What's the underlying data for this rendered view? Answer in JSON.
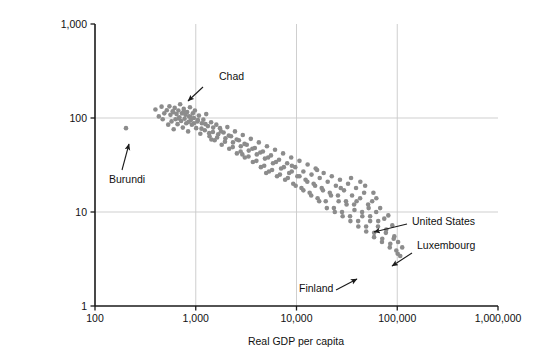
{
  "chart_data": {
    "type": "scatter",
    "title": "",
    "xlabel": "Real GDP per capita",
    "ylabel": "Child mortality (deaths per 1,000 live births)",
    "ylabel_line1": "Child mortality (deaths per",
    "ylabel_line2": "1,000 live births)",
    "xscale": "log",
    "yscale": "log",
    "xlim": [
      100,
      1000000
    ],
    "ylim": [
      1,
      1000
    ],
    "grid": true,
    "grid_color": "#c9c9c9",
    "legend": "none",
    "point_color": "#8c8c8c",
    "point_size_px": 4.6,
    "xticks": [
      100,
      1000,
      10000,
      100000,
      1000000
    ],
    "xticklabels": [
      "100",
      "1,000",
      "10,000",
      "100,000",
      "1,000,000"
    ],
    "yticks": [
      1,
      10,
      100,
      1000
    ],
    "yticklabels": [
      "1",
      "10",
      "100",
      "1,000"
    ],
    "n_points": 181,
    "annotations": [
      {
        "label": "Chad",
        "label_x": 219,
        "label_y": 80,
        "arrow_from_x": 203,
        "arrow_from_y": 87,
        "arrow_to_x": 188,
        "arrow_to_y": 101,
        "anchor": "start"
      },
      {
        "label": "Burundi",
        "label_x": 109,
        "label_y": 183,
        "arrow_from_x": 122,
        "arrow_from_y": 170,
        "arrow_to_x": 129,
        "arrow_to_y": 144,
        "anchor": "start"
      },
      {
        "label": "United States",
        "label_x": 412,
        "label_y": 225,
        "arrow_from_x": 407,
        "arrow_from_y": 224,
        "arrow_to_x": 374,
        "arrow_to_y": 232,
        "anchor": "start"
      },
      {
        "label": "Luxembourg",
        "label_x": 417,
        "label_y": 249,
        "arrow_from_x": 412,
        "arrow_from_y": 253,
        "arrow_to_x": 392,
        "arrow_to_y": 266,
        "anchor": "start"
      },
      {
        "label": "Finland",
        "label_x": 299,
        "label_y": 292,
        "arrow_from_x": 336,
        "arrow_from_y": 290,
        "arrow_to_x": 357,
        "arrow_to_y": 279,
        "anchor": "start"
      }
    ],
    "points": [
      [
        203,
        78
      ],
      [
        398,
        123
      ],
      [
        430,
        104
      ],
      [
        458,
        132
      ],
      [
        470,
        97
      ],
      [
        487,
        112
      ],
      [
        516,
        121
      ],
      [
        533,
        85
      ],
      [
        548,
        133
      ],
      [
        561,
        108
      ],
      [
        575,
        92
      ],
      [
        590,
        118
      ],
      [
        604,
        76
      ],
      [
        618,
        128
      ],
      [
        630,
        97
      ],
      [
        645,
        110
      ],
      [
        660,
        86
      ],
      [
        672,
        120
      ],
      [
        688,
        102
      ],
      [
        700,
        140
      ],
      [
        716,
        93
      ],
      [
        730,
        112
      ],
      [
        744,
        79
      ],
      [
        760,
        125
      ],
      [
        775,
        98
      ],
      [
        790,
        108
      ],
      [
        805,
        88
      ],
      [
        822,
        116
      ],
      [
        840,
        72
      ],
      [
        858,
        104
      ],
      [
        876,
        130
      ],
      [
        894,
        95
      ],
      [
        915,
        85
      ],
      [
        936,
        112
      ],
      [
        958,
        100
      ],
      [
        980,
        120
      ],
      [
        1010,
        78
      ],
      [
        1040,
        92
      ],
      [
        1075,
        106
      ],
      [
        1110,
        68
      ],
      [
        1150,
        88
      ],
      [
        1190,
        96
      ],
      [
        1230,
        74
      ],
      [
        1270,
        110
      ],
      [
        1320,
        82
      ],
      [
        1370,
        64
      ],
      [
        1420,
        90
      ],
      [
        1480,
        71
      ],
      [
        1540,
        58
      ],
      [
        1600,
        85
      ],
      [
        1670,
        67
      ],
      [
        1740,
        78
      ],
      [
        1810,
        52
      ],
      [
        1890,
        70
      ],
      [
        1970,
        61
      ],
      [
        2060,
        80
      ],
      [
        2150,
        47
      ],
      [
        2240,
        64
      ],
      [
        2340,
        55
      ],
      [
        2450,
        72
      ],
      [
        2560,
        42
      ],
      [
        2680,
        58
      ],
      [
        2800,
        50
      ],
      [
        2930,
        66
      ],
      [
        3070,
        38
      ],
      [
        3210,
        52
      ],
      [
        3360,
        45
      ],
      [
        3520,
        60
      ],
      [
        3690,
        34
      ],
      [
        3860,
        48
      ],
      [
        4040,
        41
      ],
      [
        4230,
        55
      ],
      [
        4430,
        30
      ],
      [
        4640,
        44
      ],
      [
        4860,
        37
      ],
      [
        5090,
        50
      ],
      [
        5330,
        27
      ],
      [
        5580,
        40
      ],
      [
        5840,
        33
      ],
      [
        6120,
        46
      ],
      [
        6410,
        24
      ],
      [
        6710,
        36
      ],
      [
        7030,
        29
      ],
      [
        7360,
        42
      ],
      [
        7710,
        22
      ],
      [
        8080,
        33
      ],
      [
        8460,
        26
      ],
      [
        8860,
        38
      ],
      [
        9280,
        20
      ],
      [
        9720,
        30
      ],
      [
        10200,
        24
      ],
      [
        10700,
        35
      ],
      [
        11200,
        18
      ],
      [
        11700,
        27
      ],
      [
        12300,
        22
      ],
      [
        12900,
        32
      ],
      [
        13500,
        16
      ],
      [
        14100,
        25
      ],
      [
        14800,
        20
      ],
      [
        15500,
        29
      ],
      [
        16200,
        14
      ],
      [
        17000,
        23
      ],
      [
        17800,
        18
      ],
      [
        18600,
        26
      ],
      [
        19500,
        13
      ],
      [
        20400,
        21
      ],
      [
        21400,
        16
      ],
      [
        22400,
        24
      ],
      [
        23500,
        11
      ],
      [
        24600,
        19
      ],
      [
        25800,
        15
      ],
      [
        27000,
        22
      ],
      [
        28300,
        10
      ],
      [
        29600,
        17
      ],
      [
        31000,
        13
      ],
      [
        32500,
        20
      ],
      [
        34000,
        9
      ],
      [
        35600,
        15
      ],
      [
        37300,
        12
      ],
      [
        39000,
        18
      ],
      [
        40900,
        8
      ],
      [
        42800,
        14
      ],
      [
        44800,
        10
      ],
      [
        46900,
        16
      ],
      [
        49100,
        7
      ],
      [
        51400,
        12
      ],
      [
        53800,
        9
      ],
      [
        56400,
        13
      ],
      [
        59000,
        6
      ],
      [
        61800,
        10
      ],
      [
        64700,
        8
      ],
      [
        67700,
        11
      ],
      [
        71000,
        5.2
      ],
      [
        74300,
        8.5
      ],
      [
        77800,
        6.5
      ],
      [
        81500,
        9.2
      ],
      [
        85300,
        4.6
      ],
      [
        89300,
        7.2
      ],
      [
        93500,
        5.5
      ],
      [
        97900,
        3.9
      ],
      [
        102000,
        4.8
      ],
      [
        107000,
        3.4
      ],
      [
        112000,
        4.2
      ],
      [
        880,
        103
      ],
      [
        960,
        88
      ],
      [
        1050,
        95
      ],
      [
        1140,
        77
      ],
      [
        1250,
        86
      ],
      [
        1360,
        69
      ],
      [
        1490,
        79
      ],
      [
        1630,
        62
      ],
      [
        1780,
        72
      ],
      [
        1950,
        56
      ],
      [
        2130,
        65
      ],
      [
        2330,
        49
      ],
      [
        2550,
        59
      ],
      [
        2790,
        44
      ],
      [
        3050,
        53
      ],
      [
        3340,
        39
      ],
      [
        3650,
        47
      ],
      [
        4000,
        35
      ],
      [
        4370,
        43
      ],
      [
        4780,
        31
      ],
      [
        5230,
        38
      ],
      [
        5720,
        28
      ],
      [
        6260,
        34
      ],
      [
        6850,
        25
      ],
      [
        7490,
        30
      ],
      [
        8200,
        23
      ],
      [
        8970,
        27
      ],
      [
        9810,
        19
      ],
      [
        10700,
        24
      ],
      [
        11700,
        17
      ],
      [
        12800,
        21
      ],
      [
        14000,
        15
      ],
      [
        15300,
        19
      ],
      [
        16800,
        13
      ],
      [
        18300,
        17
      ],
      [
        20000,
        11
      ],
      [
        22000,
        15
      ],
      [
        24000,
        10
      ],
      [
        26200,
        13
      ],
      [
        28700,
        9
      ],
      [
        31400,
        12
      ],
      [
        34300,
        8
      ],
      [
        37600,
        10.5
      ],
      [
        41100,
        7
      ],
      [
        45000,
        9
      ],
      [
        49200,
        6.2
      ],
      [
        53800,
        8
      ],
      [
        58900,
        5.4
      ],
      [
        64400,
        7
      ],
      [
        70500,
        4.8
      ],
      [
        77100,
        6
      ],
      [
        84300,
        4.2
      ],
      [
        92200,
        5.2
      ],
      [
        101000,
        3.6
      ],
      [
        600,
        115
      ],
      [
        680,
        99
      ],
      [
        760,
        118
      ],
      [
        850,
        91
      ],
      [
        1430,
        59
      ],
      [
        2900,
        41
      ],
      [
        5000,
        26
      ],
      [
        9000,
        31
      ],
      [
        16000,
        28
      ],
      [
        27500,
        18
      ],
      [
        43000,
        21
      ],
      [
        62000,
        14
      ],
      [
        48000,
        19
      ],
      [
        52000,
        11
      ],
      [
        58000,
        16
      ],
      [
        34800,
        23
      ],
      [
        39500,
        13
      ]
    ]
  }
}
